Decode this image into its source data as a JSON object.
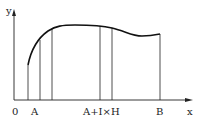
{
  "diagram": {
    "type": "function-curve-with-strips",
    "axes": {
      "x_label": "x",
      "y_label": "y",
      "origin_label": "0"
    },
    "x_tick_labels": [
      "A",
      "A+I×H",
      "B"
    ],
    "colors": {
      "stroke": "#222222",
      "background": "#ffffff"
    },
    "verticals_count": 6
  }
}
